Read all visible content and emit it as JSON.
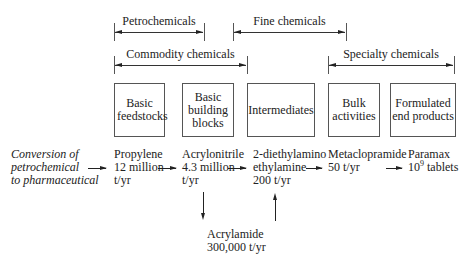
{
  "ranges": [
    {
      "label": "Petrochemicals",
      "x1": 114,
      "x2": 204,
      "y": 32
    },
    {
      "label": "Fine chemicals",
      "x1": 233,
      "x2": 346,
      "y": 32
    },
    {
      "label": "Commodity chemicals",
      "x1": 114,
      "x2": 247,
      "y": 65
    },
    {
      "label": "Specialty chemicals",
      "x1": 328,
      "x2": 454,
      "y": 65
    }
  ],
  "stages": [
    {
      "label": "Basic feedstocks"
    },
    {
      "label": "Basic building blocks"
    },
    {
      "label": "Intermediates"
    },
    {
      "label": "Bulk activities"
    },
    {
      "label": "Formulated end products"
    }
  ],
  "conversion_label": {
    "line1": "Conversion of",
    "line2": "petrochemical",
    "line3": "to pharmaceutical"
  },
  "products": [
    {
      "name": "Propylene",
      "amount": "12 million",
      "unit": "t/yr"
    },
    {
      "name": "Acrylonitrile",
      "amount": "4.3 million",
      "unit": "t/yr"
    },
    {
      "name": "2-diethylamino",
      "amount": "ethylamine",
      "unit": "200 t/yr"
    },
    {
      "name": "Metaclopramide",
      "amount": "50 t/yr",
      "unit": ""
    },
    {
      "name": "Paramax",
      "amount_base": "10",
      "amount_exp": "9",
      "amount_suffix": " tablets"
    }
  ],
  "side_product": {
    "name": "Acrylamide",
    "amount": "300,000 t/yr"
  }
}
